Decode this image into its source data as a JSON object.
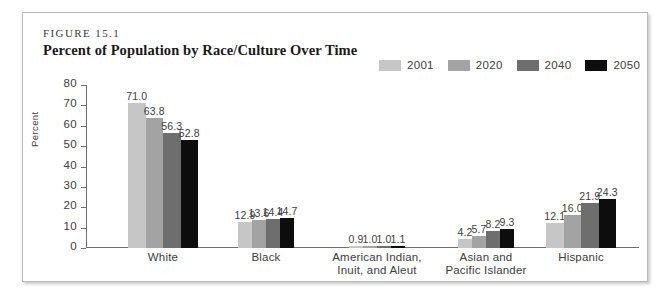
{
  "figure": {
    "number": "FIGURE 15.1",
    "title": "Percent of Population by Race/Culture Over Time"
  },
  "chart_data": {
    "type": "bar",
    "title": "Percent of Population by Race/Culture Over Time",
    "xlabel": "",
    "ylabel": "Percent",
    "ylim": [
      0,
      80
    ],
    "yticks": [
      0,
      10,
      20,
      30,
      40,
      50,
      60,
      70,
      80
    ],
    "grid": false,
    "legend_position": "top-right",
    "categories": [
      "White",
      "Black",
      "American Indian, Inuit, and Aleut",
      "Asian and Pacific Islander",
      "Hispanic"
    ],
    "category_lines": [
      [
        "White"
      ],
      [
        "Black"
      ],
      [
        "American Indian,",
        "Inuit, and Aleut"
      ],
      [
        "Asian and",
        "Pacific Islander"
      ],
      [
        "Hispanic"
      ]
    ],
    "series": [
      {
        "name": "2001",
        "color": "#c6c6c6",
        "values": [
          71.0,
          12.9,
          0.9,
          4.2,
          12.1
        ],
        "labels": [
          "71.0",
          "12.9",
          "0.9",
          "4.2",
          "12.1"
        ]
      },
      {
        "name": "2020",
        "color": "#a3a3a3",
        "values": [
          63.8,
          13.6,
          1.0,
          5.7,
          16.0
        ],
        "labels": [
          "63.8",
          "13.6",
          "1.0",
          "5.7",
          "16.0"
        ]
      },
      {
        "name": "2040",
        "color": "#6e6e6e",
        "values": [
          56.3,
          14.4,
          1.0,
          8.2,
          21.9
        ],
        "labels": [
          "56.3",
          "14.4",
          "1.0",
          "8.2",
          "21.9"
        ]
      },
      {
        "name": "2050",
        "color": "#0d0d0d",
        "values": [
          52.8,
          14.7,
          1.1,
          9.3,
          24.3
        ],
        "labels": [
          "52.8",
          "14.7",
          "1.1",
          "9.3",
          "24.3"
        ]
      }
    ]
  }
}
